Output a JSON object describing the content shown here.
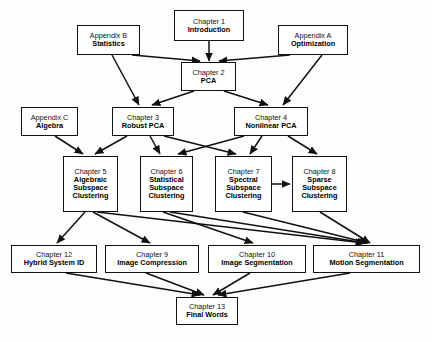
{
  "diagram": {
    "colors": {
      "node_border": "#111111",
      "node_fill": "#ffffff",
      "edge": "#111111",
      "background": "#fdfdfd"
    },
    "nodes": [
      {
        "id": "ch1",
        "title": "Chapter 1",
        "sub": "Introduction",
        "x": 174,
        "y": 10,
        "w": 70,
        "h": 31
      },
      {
        "id": "appb",
        "title": "Appendix B",
        "sub": "Statistics",
        "x": 77,
        "y": 25,
        "w": 63,
        "h": 30
      },
      {
        "id": "appa",
        "title": "Appendix A",
        "sub": "Optimization",
        "x": 278,
        "y": 25,
        "w": 70,
        "h": 30
      },
      {
        "id": "ch2",
        "title": "Chapter 2",
        "sub": "PCA",
        "x": 181,
        "y": 62,
        "w": 55,
        "h": 29
      },
      {
        "id": "appc",
        "title": "Appendix C",
        "sub": "Algebra",
        "x": 21,
        "y": 107,
        "w": 57,
        "h": 29
      },
      {
        "id": "ch3",
        "title": "Chapter 3",
        "sub": "Robust PCA",
        "x": 112,
        "y": 107,
        "w": 62,
        "h": 29
      },
      {
        "id": "ch4",
        "title": "Chapter 4",
        "sub": "Nonlinear PCA",
        "x": 234,
        "y": 107,
        "w": 74,
        "h": 29
      },
      {
        "id": "ch5",
        "title": "Chapter 5",
        "sub": "Algebraic Subspace Clustering",
        "x": 63,
        "y": 156,
        "w": 55,
        "h": 56
      },
      {
        "id": "ch6",
        "title": "Chapter 6",
        "sub": "Statistical Subspace Clustering",
        "x": 140,
        "y": 156,
        "w": 53,
        "h": 56
      },
      {
        "id": "ch7",
        "title": "Chapter 7",
        "sub": "Spectral Subspace Clustering",
        "x": 215,
        "y": 156,
        "w": 57,
        "h": 56
      },
      {
        "id": "ch8",
        "title": "Chapter 8",
        "sub": "Sparse Subspace Clustering",
        "x": 292,
        "y": 156,
        "w": 55,
        "h": 56
      },
      {
        "id": "ch12",
        "title": "Chapter 12",
        "sub": "Hybrid System ID",
        "x": 11,
        "y": 245,
        "w": 86,
        "h": 28
      },
      {
        "id": "ch9",
        "title": "Chapter 9",
        "sub": "Image Compression",
        "x": 105,
        "y": 245,
        "w": 94,
        "h": 28
      },
      {
        "id": "ch10",
        "title": "Chapter 10",
        "sub": "Image Segmentation",
        "x": 208,
        "y": 245,
        "w": 98,
        "h": 28
      },
      {
        "id": "ch11",
        "title": "Chapter 11",
        "sub": "Motion Segmentation",
        "x": 313,
        "y": 245,
        "w": 107,
        "h": 28
      },
      {
        "id": "ch13",
        "title": "Chapter 13",
        "sub": "Final Words",
        "x": 176,
        "y": 297,
        "w": 62,
        "h": 28
      }
    ],
    "edges": [
      {
        "from": "ch1",
        "to": "ch2",
        "x1": 209,
        "y1": 41,
        "x2": 209,
        "y2": 61
      },
      {
        "from": "appb",
        "to": "ch2",
        "x1": 132,
        "y1": 55,
        "x2": 200,
        "y2": 61
      },
      {
        "from": "appa",
        "to": "ch2",
        "x1": 290,
        "y1": 55,
        "x2": 219,
        "y2": 61
      },
      {
        "from": "appb",
        "to": "ch3",
        "x1": 112,
        "y1": 55,
        "x2": 139,
        "y2": 105
      },
      {
        "from": "appa",
        "to": "ch4",
        "x1": 322,
        "y1": 55,
        "x2": 283,
        "y2": 105
      },
      {
        "from": "ch2",
        "to": "ch3",
        "x1": 194,
        "y1": 91,
        "x2": 152,
        "y2": 105
      },
      {
        "from": "ch2",
        "to": "ch4",
        "x1": 224,
        "y1": 91,
        "x2": 268,
        "y2": 105
      },
      {
        "from": "appc",
        "to": "ch5",
        "x1": 55,
        "y1": 136,
        "x2": 83,
        "y2": 154
      },
      {
        "from": "ch3",
        "to": "ch5",
        "x1": 127,
        "y1": 136,
        "x2": 95,
        "y2": 154
      },
      {
        "from": "ch3",
        "to": "ch6",
        "x1": 150,
        "y1": 136,
        "x2": 160,
        "y2": 154
      },
      {
        "from": "ch3",
        "to": "ch7",
        "x1": 164,
        "y1": 136,
        "x2": 236,
        "y2": 154
      },
      {
        "from": "ch4",
        "to": "ch6",
        "x1": 244,
        "y1": 136,
        "x2": 178,
        "y2": 154
      },
      {
        "from": "ch4",
        "to": "ch7",
        "x1": 262,
        "y1": 136,
        "x2": 250,
        "y2": 154
      },
      {
        "from": "ch4",
        "to": "ch8",
        "x1": 288,
        "y1": 136,
        "x2": 317,
        "y2": 154
      },
      {
        "from": "ch7",
        "to": "ch8",
        "x1": 272,
        "y1": 184,
        "x2": 290,
        "y2": 184
      },
      {
        "from": "ch5",
        "to": "ch12",
        "x1": 85,
        "y1": 212,
        "x2": 57,
        "y2": 243
      },
      {
        "from": "ch5",
        "to": "ch9",
        "x1": 93,
        "y1": 212,
        "x2": 150,
        "y2": 243
      },
      {
        "from": "ch5",
        "to": "ch11",
        "x1": 97,
        "y1": 212,
        "x2": 364,
        "y2": 243
      },
      {
        "from": "ch6",
        "to": "ch10",
        "x1": 163,
        "y1": 212,
        "x2": 253,
        "y2": 243
      },
      {
        "from": "ch6",
        "to": "ch11",
        "x1": 170,
        "y1": 212,
        "x2": 366,
        "y2": 243
      },
      {
        "from": "ch7",
        "to": "ch11",
        "x1": 243,
        "y1": 212,
        "x2": 368,
        "y2": 243
      },
      {
        "from": "ch8",
        "to": "ch11",
        "x1": 320,
        "y1": 212,
        "x2": 370,
        "y2": 243
      },
      {
        "from": "ch12",
        "to": "ch13",
        "x1": 66,
        "y1": 273,
        "x2": 200,
        "y2": 295
      },
      {
        "from": "ch9",
        "to": "ch13",
        "x1": 146,
        "y1": 273,
        "x2": 204,
        "y2": 295
      },
      {
        "from": "ch10",
        "to": "ch13",
        "x1": 250,
        "y1": 273,
        "x2": 213,
        "y2": 295
      },
      {
        "from": "ch11",
        "to": "ch13",
        "x1": 350,
        "y1": 273,
        "x2": 218,
        "y2": 295
      }
    ]
  }
}
